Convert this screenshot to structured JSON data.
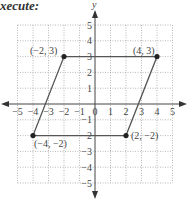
{
  "heading": "xecute:",
  "chart_data": {
    "type": "scatter",
    "title": "",
    "xlabel": "x",
    "ylabel": "y",
    "xlim": [
      -5,
      5
    ],
    "ylim": [
      -5,
      5
    ],
    "grid": true,
    "x_ticks": [
      "-5",
      "-4",
      "-3",
      "-2",
      "-1",
      "0",
      "1",
      "2",
      "3",
      "4",
      "5"
    ],
    "y_ticks": [
      "-5",
      "-4",
      "-3",
      "-2",
      "-1",
      "1",
      "2",
      "3",
      "4",
      "5"
    ],
    "points": [
      {
        "x": -2,
        "y": 3,
        "label": "(−2, 3)"
      },
      {
        "x": 4,
        "y": 3,
        "label": "(4, 3)"
      },
      {
        "x": 2,
        "y": -2,
        "label": "(2, −2)"
      },
      {
        "x": -4,
        "y": -2,
        "label": "(−4, −2)"
      }
    ],
    "shape": "parallelogram",
    "colors": {
      "grid": "#9a9a9a",
      "lines": "#555555",
      "points": "#222222"
    }
  }
}
